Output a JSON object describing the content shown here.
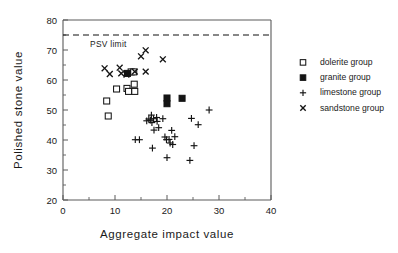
{
  "chart_data": {
    "type": "scatter",
    "title": "",
    "xlabel": "Aggregate  impact  value",
    "ylabel": "Polished  stone  value",
    "xlim": [
      0,
      40
    ],
    "ylim": [
      20,
      80
    ],
    "x_ticks": [
      0,
      10,
      20,
      30,
      40
    ],
    "y_ticks": [
      20,
      30,
      40,
      50,
      60,
      70,
      80
    ],
    "x_minor_step": 5,
    "y_minor_step": 5,
    "grid": false,
    "legend_position": "right",
    "annotations": [
      {
        "name": "psv-limit",
        "label": "PSV  limit",
        "type": "hline",
        "y": 75,
        "style": "dashed"
      }
    ],
    "series": [
      {
        "name": "dolerite group",
        "marker": "open-square",
        "points": [
          [
            8.4,
            53.0
          ],
          [
            8.7,
            48.0
          ],
          [
            10.3,
            57.0
          ],
          [
            12.3,
            57.2
          ],
          [
            12.6,
            56.2
          ],
          [
            13.1,
            62.7
          ],
          [
            13.6,
            62.7
          ],
          [
            13.7,
            58.6
          ],
          [
            13.8,
            56.2
          ]
        ]
      },
      {
        "name": "granite group",
        "marker": "filled-square",
        "points": [
          [
            12.4,
            62.2
          ],
          [
            20.0,
            54.0
          ],
          [
            20.0,
            52.1
          ],
          [
            22.9,
            53.9
          ]
        ]
      },
      {
        "name": "limestone group",
        "marker": "plus",
        "points": [
          [
            13.9,
            40.1
          ],
          [
            14.7,
            40.1
          ],
          [
            16.1,
            46.4
          ],
          [
            16.5,
            47.0
          ],
          [
            16.8,
            46.6
          ],
          [
            17.0,
            48.3
          ],
          [
            17.1,
            45.8
          ],
          [
            17.2,
            37.3
          ],
          [
            17.4,
            47.1
          ],
          [
            17.5,
            43.3
          ],
          [
            18.0,
            47.5
          ],
          [
            18.1,
            46.2
          ],
          [
            18.4,
            44.1
          ],
          [
            19.2,
            47.1
          ],
          [
            19.6,
            41.0
          ],
          [
            19.9,
            40.1
          ],
          [
            20.0,
            34.1
          ],
          [
            20.4,
            40.2
          ],
          [
            20.6,
            39.0
          ],
          [
            20.9,
            43.2
          ],
          [
            21.1,
            38.5
          ],
          [
            21.5,
            41.1
          ],
          [
            24.4,
            33.2
          ],
          [
            24.7,
            47.2
          ],
          [
            25.2,
            38.1
          ],
          [
            26.0,
            45.1
          ],
          [
            28.1,
            50.0
          ]
        ]
      },
      {
        "name": "sandstone group",
        "marker": "cross",
        "points": [
          [
            8.0,
            63.9
          ],
          [
            9.0,
            62.0
          ],
          [
            10.9,
            64.1
          ],
          [
            11.2,
            62.2
          ],
          [
            12.2,
            61.8
          ],
          [
            13.8,
            62.8
          ],
          [
            15.0,
            67.9
          ],
          [
            15.9,
            69.9
          ],
          [
            15.9,
            62.8
          ],
          [
            19.2,
            66.9
          ]
        ]
      }
    ]
  },
  "legend": {
    "entries": [
      {
        "label": "dolerite group",
        "marker": "open-square"
      },
      {
        "label": "granite group",
        "marker": "filled-square"
      },
      {
        "label": "limestone group",
        "marker": "plus"
      },
      {
        "label": "sandstone group",
        "marker": "cross"
      }
    ]
  }
}
